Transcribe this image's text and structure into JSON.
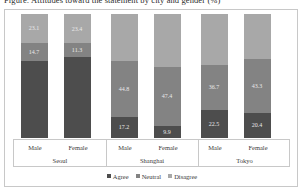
{
  "title": "Figure: Attitudes toward the statement by city and gender (%)",
  "legend": {
    "position": "bottom",
    "items": [
      {
        "label": "Agree",
        "color": "#4d4d4d",
        "key": "agree"
      },
      {
        "label": "Neutral",
        "color": "#838383",
        "key": "neutral"
      },
      {
        "label": "Disagree",
        "color": "#a8a8a8",
        "key": "disagree"
      }
    ]
  },
  "axis": {
    "gender_labels": [
      "Male",
      "Female",
      "Male",
      "Female",
      "Male",
      "Female"
    ],
    "city_labels": [
      "Seoul",
      "Shanghai",
      "Tokyo"
    ]
  },
  "chart_data": {
    "type": "bar",
    "subtype": "stacked-100-percent",
    "title": "Figure: Attitudes toward the statement by city and gender (%)",
    "xlabel": "",
    "ylabel": "",
    "ylim": [
      0,
      100
    ],
    "grid": false,
    "legend_position": "bottom",
    "stack_order_bottom_to_top": [
      "Agree",
      "Neutral",
      "Disagree"
    ],
    "groups": [
      "Seoul",
      "Shanghai",
      "Tokyo"
    ],
    "categories": [
      "Seoul / Male",
      "Seoul / Female",
      "Shanghai / Male",
      "Shanghai / Female",
      "Tokyo / Male",
      "Tokyo / Female"
    ],
    "series": [
      {
        "name": "Agree",
        "color": "#4d4d4d",
        "values": [
          62.2,
          65.3,
          17.2,
          9.9,
          22.5,
          20.4
        ]
      },
      {
        "name": "Neutral",
        "color": "#838383",
        "values": [
          14.7,
          11.3,
          44.8,
          47.4,
          36.7,
          43.3
        ]
      },
      {
        "name": "Disagree",
        "color": "#a8a8a8",
        "values": [
          23.1,
          23.4,
          38.0,
          42.7,
          40.8,
          36.3
        ]
      }
    ],
    "visible_data_labels": {
      "agree": [
        null,
        null,
        "17.2",
        "9.9",
        "22.5",
        "20.4"
      ],
      "neutral": [
        "14.7",
        "11.3",
        "44.8",
        "47.4",
        "36.7",
        "43.3"
      ],
      "disagree": [
        "23.1",
        "23.4",
        null,
        null,
        null,
        null
      ]
    }
  },
  "bars": [
    {
      "group": "Seoul",
      "gender": "Male",
      "agree": {
        "value": 62.2,
        "label": "",
        "show_label": false
      },
      "neutral": {
        "value": 14.7,
        "label": "14.7",
        "show_label": true
      },
      "disagree": {
        "value": 23.1,
        "label": "23.1",
        "show_label": true
      }
    },
    {
      "group": "Seoul",
      "gender": "Female",
      "agree": {
        "value": 65.3,
        "label": "",
        "show_label": false
      },
      "neutral": {
        "value": 11.3,
        "label": "11.3",
        "show_label": true
      },
      "disagree": {
        "value": 23.4,
        "label": "23.4",
        "show_label": true
      }
    },
    {
      "group": "Shanghai",
      "gender": "Male",
      "agree": {
        "value": 17.2,
        "label": "17.2",
        "show_label": true
      },
      "neutral": {
        "value": 44.8,
        "label": "44.8",
        "show_label": true
      },
      "disagree": {
        "value": 38.0,
        "label": "",
        "show_label": false
      }
    },
    {
      "group": "Shanghai",
      "gender": "Female",
      "agree": {
        "value": 9.9,
        "label": "9.9",
        "show_label": true
      },
      "neutral": {
        "value": 47.4,
        "label": "47.4",
        "show_label": true
      },
      "disagree": {
        "value": 42.7,
        "label": "",
        "show_label": false
      }
    },
    {
      "group": "Tokyo",
      "gender": "Male",
      "agree": {
        "value": 22.5,
        "label": "22.5",
        "show_label": true
      },
      "neutral": {
        "value": 36.7,
        "label": "36.7",
        "show_label": true
      },
      "disagree": {
        "value": 40.8,
        "label": "",
        "show_label": false
      }
    },
    {
      "group": "Tokyo",
      "gender": "Female",
      "agree": {
        "value": 20.4,
        "label": "20.4",
        "show_label": true
      },
      "neutral": {
        "value": 43.3,
        "label": "43.3",
        "show_label": true
      },
      "disagree": {
        "value": 36.3,
        "label": "",
        "show_label": false
      }
    }
  ],
  "colors": {
    "agree": "#4d4d4d",
    "neutral": "#838383",
    "disagree": "#a8a8a8",
    "frame": "#c8c8c8",
    "label_text": "#e8e8e8",
    "axis_text": "#3a3a3a",
    "background": "#ffffff"
  }
}
